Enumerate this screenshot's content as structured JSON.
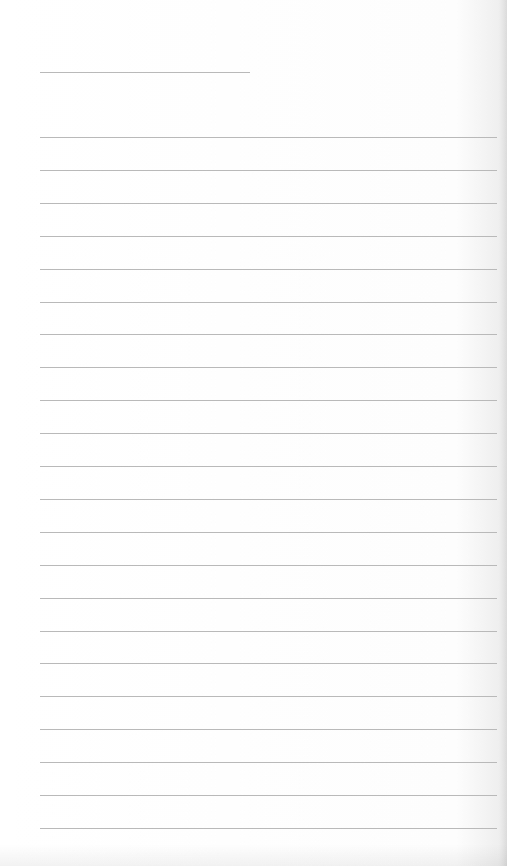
{
  "page": {
    "type": "blank lined paper",
    "background_color": "#fdfdfd",
    "line_color": "#b9b9b9"
  },
  "header_line": {
    "x": 40,
    "y": 72,
    "width": 210
  },
  "ruled_lines": {
    "x": 40,
    "width": 457,
    "start_y": 137,
    "spacing": 32.9,
    "count": 22
  }
}
